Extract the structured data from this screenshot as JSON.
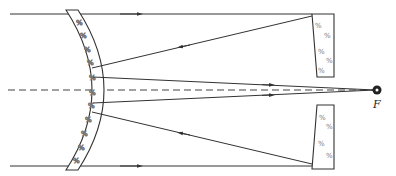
{
  "diagram": {
    "focus_label": "F",
    "colors": {
      "line": "#333333",
      "background": "#ffffff",
      "hatch": "#777777"
    },
    "elements": [
      {
        "name": "primary-mirror",
        "kind": "curved-glass"
      },
      {
        "name": "secondary-mirror-top",
        "kind": "flat-glass-block"
      },
      {
        "name": "secondary-mirror-bottom",
        "kind": "flat-glass-block"
      },
      {
        "name": "optical-axis",
        "kind": "dashed-line"
      },
      {
        "name": "focal-point",
        "kind": "point",
        "label": "F"
      }
    ]
  }
}
